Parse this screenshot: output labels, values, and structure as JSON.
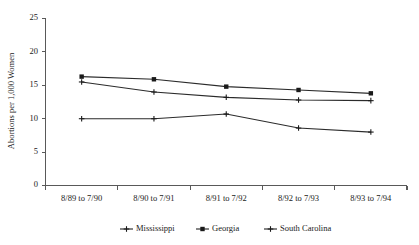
{
  "chart_data": {
    "type": "line",
    "title": "",
    "xlabel": "",
    "ylabel": "Abortions per 1,000 Women",
    "ylim": [
      0,
      25
    ],
    "yticks": [
      0,
      5,
      10,
      15,
      20,
      25
    ],
    "grid": false,
    "legend_position": "bottom",
    "categories": [
      "8/89 to 7/90",
      "8/90 to 7/91",
      "8/91 to 7/92",
      "8/92 to 7/93",
      "8/93 to 7/94"
    ],
    "series": [
      {
        "name": "Mississippi",
        "marker": "cross",
        "values": [
          15.5,
          14.0,
          13.2,
          12.8,
          12.7
        ]
      },
      {
        "name": "Georgia",
        "marker": "square",
        "values": [
          16.3,
          15.9,
          14.8,
          14.3,
          13.8
        ]
      },
      {
        "name": "South Carolina",
        "marker": "cross",
        "values": [
          10.0,
          10.0,
          10.7,
          8.6,
          8.0
        ]
      }
    ],
    "colors": {
      "line": "#2b2b2b",
      "axis": "#595959",
      "text": "#1a1a1a",
      "background": "#ffffff"
    }
  },
  "axis": {
    "y_title": "Abortions per 1,000 Women",
    "y_tick_labels": [
      "0",
      "5",
      "10",
      "15",
      "20",
      "25"
    ],
    "x_tick_labels": [
      "8/89 to 7/90",
      "8/90 to 7/91",
      "8/91 to 7/92",
      "8/92 to 7/93",
      "8/93 to 7/94"
    ]
  },
  "legend": {
    "entries": [
      {
        "label": "Mississippi",
        "marker": "cross"
      },
      {
        "label": "Georgia",
        "marker": "square"
      },
      {
        "label": "South Carolina",
        "marker": "cross"
      }
    ]
  }
}
